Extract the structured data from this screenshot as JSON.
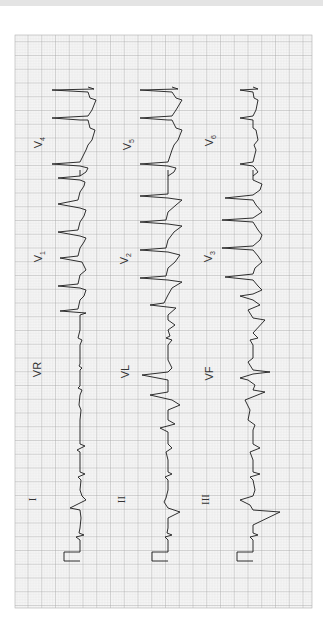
{
  "figure": {
    "type": "12-lead ECG (rotated 90°)",
    "orientation": "rotated counterclockwise, time runs bottom to top",
    "grid": {
      "minor_color": "#d4d4d4",
      "major_color": "#9a9a9a",
      "background": "#f7f7f7",
      "trace_color": "#1a1a1a"
    },
    "rows": [
      {
        "leads": [
          {
            "name": "I",
            "label": "I"
          },
          {
            "name": "VR",
            "label": "VR"
          },
          {
            "name": "V1",
            "label": "V",
            "sub": "1"
          },
          {
            "name": "V4",
            "label": "V",
            "sub": "4"
          }
        ]
      },
      {
        "leads": [
          {
            "name": "II",
            "label": "II"
          },
          {
            "name": "VL",
            "label": "VL"
          },
          {
            "name": "V2",
            "label": "V",
            "sub": "2"
          },
          {
            "name": "V5",
            "label": "V",
            "sub": "5"
          }
        ]
      },
      {
        "leads": [
          {
            "name": "III",
            "label": "III"
          },
          {
            "name": "VF",
            "label": "VF"
          },
          {
            "name": "V3",
            "label": "V",
            "sub": "3"
          },
          {
            "name": "V6",
            "label": "V",
            "sub": "6"
          }
        ]
      }
    ]
  }
}
